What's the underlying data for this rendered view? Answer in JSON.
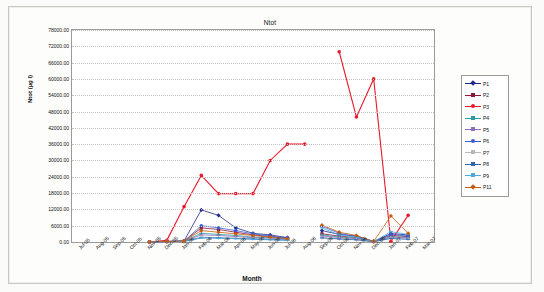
{
  "chart_data": {
    "type": "line",
    "title": "Ntot",
    "xlabel": "Month",
    "ylabel": "Ntot (µg l)",
    "ylim": [
      0,
      78000
    ],
    "ytick_step": 6000,
    "ytick_labels": [
      "0.00",
      "6000.00",
      "12000.00",
      "18000.00",
      "24000.00",
      "30000.00",
      "36000.00",
      "42000.00",
      "48000.00",
      "54000.00",
      "60000.00",
      "66000.00",
      "72000.00",
      "78000.00"
    ],
    "grid": true,
    "legend_position": "right",
    "categories": [
      "Jul-05",
      "Aug-05",
      "Sep-05",
      "Oct-05",
      "Nov-05",
      "Dec-05",
      "Jan-06",
      "Feb-06",
      "Mar-06",
      "Apr-06",
      "May-06",
      "Jun-06",
      "Jul-06",
      "Aug-06",
      "Sep-06",
      "Oct-06",
      "Nov-06",
      "Dec-06",
      "Jan-07",
      "Feb-07",
      "Mar-07"
    ],
    "series": [
      {
        "name": "P1",
        "color": "#1f2a8c",
        "marker": "diamond",
        "values": [
          null,
          null,
          null,
          null,
          0,
          200,
          400,
          11800,
          9800,
          5200,
          3200,
          2600,
          1600,
          null,
          4200,
          2800,
          2200,
          200,
          3100,
          2600,
          null
        ]
      },
      {
        "name": "P2",
        "color": "#8a1538",
        "marker": "square",
        "values": [
          null,
          null,
          null,
          null,
          0,
          200,
          300,
          5200,
          4600,
          3600,
          2600,
          2000,
          1400,
          null,
          3000,
          2200,
          1600,
          200,
          2400,
          2000,
          null
        ]
      },
      {
        "name": "P3",
        "color": "#e8192c",
        "marker": "circle",
        "values": [
          null,
          null,
          null,
          null,
          0,
          600,
          13000,
          24500,
          17800,
          17800,
          17800,
          30000,
          36000,
          36000,
          null,
          70000,
          46000,
          60000,
          300,
          9800,
          null
        ]
      },
      {
        "name": "P4",
        "color": "#2aa0a4",
        "marker": "cross",
        "values": [
          null,
          null,
          null,
          null,
          0,
          200,
          300,
          3200,
          2800,
          2400,
          1800,
          1600,
          1200,
          null,
          2600,
          1800,
          1400,
          150,
          2000,
          1600,
          null
        ]
      },
      {
        "name": "P5",
        "color": "#8f6fb5",
        "marker": "star",
        "values": [
          null,
          null,
          null,
          null,
          0,
          200,
          300,
          2600,
          2400,
          2000,
          1600,
          1400,
          1000,
          null,
          2200,
          1600,
          1200,
          150,
          1800,
          1500,
          null
        ]
      },
      {
        "name": "P6",
        "color": "#3b5fd0",
        "marker": "circle",
        "values": [
          null,
          null,
          null,
          null,
          0,
          200,
          300,
          6000,
          5200,
          4200,
          3000,
          2200,
          1500,
          null,
          5800,
          3200,
          2000,
          200,
          2800,
          2200,
          null
        ]
      },
      {
        "name": "P7",
        "color": "#b9b9b9",
        "marker": "plus",
        "values": [
          null,
          null,
          null,
          null,
          0,
          150,
          250,
          1800,
          1600,
          1400,
          1200,
          1000,
          800,
          null,
          1600,
          1200,
          900,
          100,
          1400,
          1100,
          null
        ]
      },
      {
        "name": "P8",
        "color": "#2f66b5",
        "marker": "dash",
        "values": [
          null,
          null,
          null,
          null,
          0,
          150,
          250,
          1600,
          1500,
          1300,
          1100,
          900,
          700,
          null,
          1500,
          1100,
          800,
          100,
          1300,
          1000,
          null
        ]
      },
      {
        "name": "P9",
        "color": "#4aa8e0",
        "marker": "dash",
        "values": [
          null,
          null,
          null,
          null,
          0,
          150,
          250,
          1500,
          1400,
          1200,
          1000,
          800,
          600,
          null,
          5200,
          2600,
          1800,
          120,
          3800,
          2800,
          null
        ]
      },
      {
        "name": "P11",
        "color": "#c55a11",
        "marker": "diamond",
        "values": [
          null,
          null,
          null,
          null,
          0,
          200,
          350,
          4200,
          3600,
          3000,
          2400,
          1800,
          1200,
          null,
          6200,
          3600,
          2400,
          200,
          9600,
          3200,
          null
        ]
      }
    ]
  },
  "legend": {
    "items": [
      "P1",
      "P2",
      "P3",
      "P4",
      "P5",
      "P6",
      "P7",
      "P8",
      "P9",
      "P11"
    ]
  }
}
